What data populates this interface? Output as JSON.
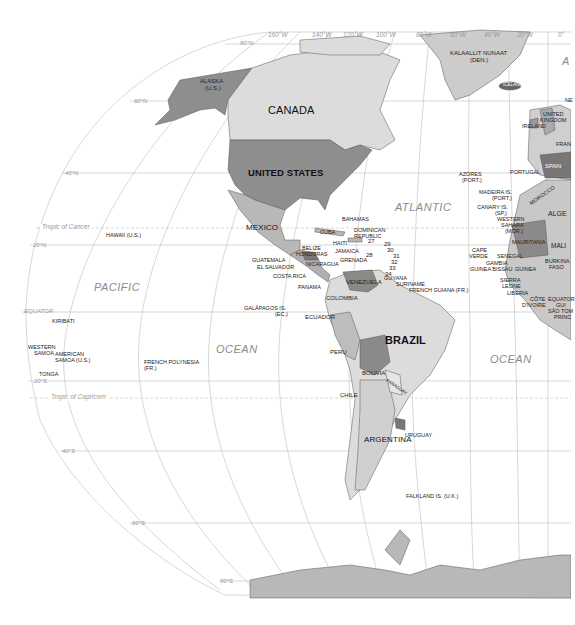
{
  "map": {
    "projection": "Robinson-style world map, Western Hemisphere",
    "colors": {
      "background": "#ffffff",
      "ocean": "#ffffff",
      "grid_line": "#b8b8b8",
      "land_light": "#d6d6d6",
      "land_mid": "#b4b4b4",
      "land_dark": "#8a8a8a",
      "border": "#444444"
    },
    "longitude_labels": [
      "160°W",
      "140°W",
      "120°W",
      "100°W",
      "80°W",
      "60°W",
      "40°W",
      "20°W",
      "0°"
    ],
    "latitude_labels": {
      "n80": "80°N",
      "n60": "60°N",
      "n40": "40°N",
      "n20": "20°N",
      "equator": "EQUATOR",
      "s20": "20°S",
      "s40": "40°S",
      "s60": "60°S",
      "s80": "80°S"
    },
    "special_lines": {
      "tropic_cancer": "Tropic of Cancer",
      "tropic_capricorn": "Tropic of Capricorn"
    },
    "oceans": {
      "pacific": "PACIFIC",
      "pacific_ocean": "OCEAN",
      "atlantic": "ATLANTIC",
      "atlantic_ocean": "OCEAN",
      "atlantic_partial": "A"
    },
    "countries_large": {
      "canada": "CANADA",
      "united_states": "UNITED STATES",
      "mexico": "MEXICO",
      "brazil": "BRAZIL",
      "argentina": "ARGENTINA",
      "colombia": "COLOMBIA",
      "venezuela": "VENEZUELA",
      "peru": "PERU",
      "bolivia": "BOLIVIA",
      "chile": "CHILE",
      "ecuador": "ECUADOR",
      "paraguay": "PARAGUAY",
      "uruguay": "URUGUAY"
    },
    "labels_small": {
      "alaska": "ALASKA",
      "alaska_sub": "(U.S.)",
      "greenland": "KALAALLIT NUNAAT",
      "greenland_sub": "(DEN.)",
      "iceland": "ICELAND",
      "ireland": "IRELAND",
      "uk_1": "UNITED",
      "uk_2": "KINGDOM",
      "france": "FRAN",
      "spain": "SPAIN",
      "portugal": "PORTUGAL",
      "morocco": "MOROCCO",
      "algeria": "ALGE",
      "western_sahara_1": "WESTERN",
      "western_sahara_2": "SAHARA",
      "western_sahara_3": "(MOR.)",
      "mauritania": "MAURITANIA",
      "mali": "MALI",
      "senegal": "SENEGAL",
      "gambia": "GAMBIA",
      "guinea_bissau": "GUINEA BISSAU",
      "guinea": "GUINEA",
      "sierra_leone_1": "SIERRA",
      "sierra_leone_2": "LEONE",
      "liberia": "LIBERIA",
      "cote_divoire_1": "CÔTE",
      "cote_divoire_2": "D'IVOIRE",
      "burkina_1": "BURKINA",
      "burkina_2": "FASO",
      "equatorial_guinea_1": "EQUATOR",
      "equatorial_guinea_2": "GUI",
      "sao_tome_1": "SÃO TOM",
      "sao_tome_2": "PRINC",
      "cape_verde_1": "CAPE",
      "cape_verde_2": "VERDE",
      "azores_1": "AZORES",
      "azores_2": "(PORT.)",
      "madeira_1": "MADEIRA IS.",
      "madeira_2": "(PORT.)",
      "canary_1": "CANARY IS.",
      "canary_2": "(SP.)",
      "hawaii": "HAWAII (U.S.)",
      "bahamas": "BAHAMAS",
      "cuba": "CUBA",
      "haiti": "HAITI",
      "dominican_1": "DOMINICAN",
      "dominican_2": "REPUBLIC",
      "jamaica": "JAMAICA",
      "belize": "BELIZE",
      "honduras": "HONDURAS",
      "guatemala": "GUATEMALA",
      "el_salvador": "EL SALVADOR",
      "nicaragua": "NICARAGUA",
      "costa_rica": "COSTA RICA",
      "panama": "PANAMA",
      "grenada": "GRENADA",
      "guyana": "GUYANA",
      "suriname": "SURINAME",
      "french_guiana": "FRENCH GUIANA (FR.)",
      "galapagos_1": "GALÁPAGOS IS.",
      "galapagos_2": "(EC.)",
      "kiribati": "KIRIBATI",
      "western_samoa_1": "WESTERN",
      "western_samoa_2": "SAMOA",
      "american_samoa_1": "AMERICAN",
      "american_samoa_2": "SAMOA (U.S.)",
      "tonga": "TONGA",
      "french_polynesia_1": "FRENCH POLYNESIA",
      "french_polynesia_2": "(FR.)",
      "falkland": "FALKLAND IS. (U.K.)",
      "n_partial": "NE"
    },
    "caribbean_numbers": [
      "27",
      "28",
      "29",
      "30",
      "31",
      "32",
      "33",
      "34"
    ]
  }
}
